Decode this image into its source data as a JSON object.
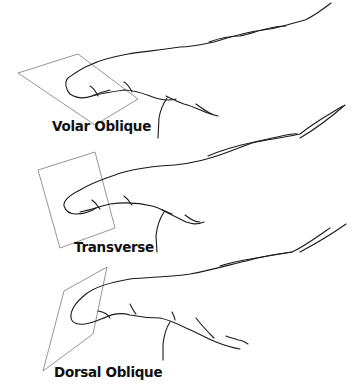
{
  "figure": {
    "views": [
      {
        "id": "volar-oblique",
        "label": "Volar Oblique"
      },
      {
        "id": "transverse",
        "label": "Transverse"
      },
      {
        "id": "dorsal-oblique",
        "label": "Dorsal Oblique"
      }
    ]
  }
}
